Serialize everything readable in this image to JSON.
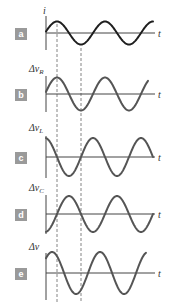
{
  "figure": {
    "period_px": 48,
    "y_axis_x": 46,
    "axis_end_x": 155,
    "reference_peak_x": 57,
    "dashed_lines": [
      {
        "x": 57,
        "y1": 24,
        "y2": 302
      },
      {
        "x": 81,
        "y1": 48,
        "y2": 302
      }
    ],
    "colors": {
      "current_curve": "#1e1e1e",
      "voltage_curve": "#555555",
      "axis": "#444444",
      "badge": "#9a9a9a",
      "dashed": "#666666"
    }
  },
  "panels": [
    {
      "id": "a",
      "badge": "a",
      "badge_y": 28,
      "label": "i",
      "label_sub": "",
      "label_x": 43,
      "label_y": 14,
      "axis_y": 33,
      "axis_top": 16,
      "axis_bottom": 50,
      "amplitude": 11.5,
      "phase_deg": 0,
      "curve_end_x": 153,
      "curve": "current",
      "t_label": "t",
      "t_label_y": 37
    },
    {
      "id": "b",
      "badge": "b",
      "badge_y": 89,
      "label": "Δv",
      "label_sub": "R",
      "label_x": 29,
      "label_y": 72,
      "axis_y": 94,
      "axis_top": 76,
      "axis_bottom": 112,
      "amplitude": 16.5,
      "phase_deg": 0,
      "curve_end_x": 148,
      "curve": "voltage",
      "t_label": "t",
      "t_label_y": 98
    },
    {
      "id": "c",
      "badge": "c",
      "badge_y": 152,
      "label": "Δv",
      "label_sub": "L",
      "label_x": 29,
      "label_y": 131,
      "axis_y": 157,
      "axis_top": 136,
      "axis_bottom": 178,
      "amplitude": 19,
      "phase_deg": 90,
      "curve_end_x": 153,
      "curve": "voltage",
      "t_label": "t",
      "t_label_y": 161
    },
    {
      "id": "d",
      "badge": "d",
      "badge_y": 209,
      "label": "Δv",
      "label_sub": "C",
      "label_x": 29,
      "label_y": 191,
      "axis_y": 214,
      "axis_top": 195,
      "axis_bottom": 234,
      "amplitude": 18,
      "phase_deg": -90,
      "curve_end_x": 153,
      "curve": "voltage",
      "t_label": "t",
      "t_label_y": 218
    },
    {
      "id": "e",
      "badge": "e",
      "badge_y": 268,
      "label": "Δv",
      "label_sub": "",
      "label_x": 29,
      "label_y": 250,
      "axis_y": 273,
      "axis_top": 253,
      "axis_bottom": 300,
      "amplitude": 21,
      "phase_deg": 37,
      "curve_end_x": 146,
      "curve": "voltage",
      "t_label": "t",
      "t_label_y": 277
    }
  ]
}
